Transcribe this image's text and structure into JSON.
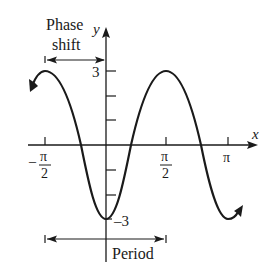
{
  "diagram": {
    "function": "y = -3cos(2x)",
    "labels": {
      "phase_shift_line1": "Phase",
      "phase_shift_line2": "shift",
      "period": "Period",
      "x_axis": "x",
      "y_axis": "y"
    },
    "ticks": {
      "x": [
        {
          "num": "π",
          "den": "2",
          "neg": true,
          "value": "-π/2"
        },
        {
          "num": "π",
          "den": "2",
          "neg": false,
          "value": "π/2"
        },
        {
          "label": "π",
          "value": "π"
        }
      ],
      "y": [
        {
          "label": "3",
          "value": 3
        },
        {
          "label": "–3",
          "value": -3
        }
      ],
      "x_minus_sign": "–"
    },
    "colors": {
      "ink": "#1a1a1a",
      "background": "#ffffff"
    }
  }
}
